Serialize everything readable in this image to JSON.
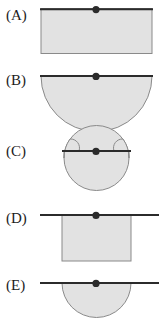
{
  "figure": {
    "title": "",
    "width": 167,
    "height": 331,
    "background_color": "#ffffff",
    "style": {
      "shape_fill_color": "#e2e2e2",
      "shape_stroke_color": "#8c8c8c",
      "line_color": "#2b2b2b",
      "dot_color": "#2b2b2b",
      "label_color": "#1c1c1c"
    },
    "options": [
      {
        "id": "A",
        "label": "(A)",
        "label_x": 5,
        "label_y": 22,
        "shape_type": "rectangle",
        "shape_description": "Wide shaded rectangle with horizontal line along its top edge and pivot dot on the line",
        "shape": {
          "x": 41,
          "y": 8,
          "width": 111,
          "height": 45
        },
        "line": {
          "x1": 41,
          "y1": 9,
          "x2": 152,
          "y2": 9
        },
        "dot": {
          "cx": 96,
          "cy": 9,
          "r": 3.6
        }
      },
      {
        "id": "B",
        "label": "(B)",
        "label_x": 5,
        "label_y": 87,
        "shape_type": "semicircle",
        "shape_description": "Wide shaded half-disk hanging below a horizontal line, pivot dot on the line",
        "shape": {
          "cx": 96.5,
          "cy": 76,
          "r": 55.5
        },
        "line": {
          "x1": 41,
          "y1": 76,
          "x2": 152,
          "y2": 76
        },
        "dot": {
          "cx": 96,
          "cy": 76,
          "r": 3.6
        }
      },
      {
        "id": "C",
        "label": "(C)",
        "label_x": 5,
        "label_y": 158,
        "shape_type": "circle-chord",
        "shape_description": "Shaded disk whose top arc rises above the horizontal chord line on both sides, pivot dot on the line",
        "shape": {
          "cx": 96.5,
          "cy": 158,
          "r": 42
        },
        "line": {
          "x1": 62,
          "y1": 151,
          "x2": 131,
          "y2": 151
        },
        "dot": {
          "cx": 96,
          "cy": 151,
          "r": 3.6
        }
      },
      {
        "id": "D",
        "label": "(D)",
        "label_x": 5,
        "label_y": 225,
        "shape_type": "rectangle",
        "shape_description": "Narrow shaded rectangle hanging below a horizontal line that overhangs both sides, pivot dot on the line",
        "shape": {
          "x": 62,
          "y": 215,
          "width": 69,
          "height": 46
        },
        "line": {
          "x1": 41,
          "y1": 215,
          "x2": 158,
          "y2": 215
        },
        "dot": {
          "cx": 96,
          "cy": 215,
          "r": 3.6
        }
      },
      {
        "id": "E",
        "label": "(E)",
        "label_x": 5,
        "label_y": 292,
        "shape_type": "semicircle",
        "shape_description": "Narrow shaded half-disk hanging below a horizontal line that overhangs both sides, pivot dot on the line",
        "shape": {
          "cx": 96.5,
          "cy": 283,
          "r": 34.5
        },
        "line": {
          "x1": 41,
          "y1": 283,
          "x2": 158,
          "y2": 283
        },
        "dot": {
          "cx": 96,
          "cy": 283,
          "r": 3.6
        }
      }
    ]
  }
}
